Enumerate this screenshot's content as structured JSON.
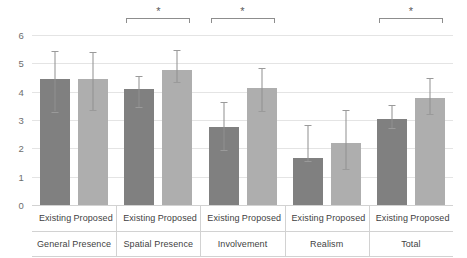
{
  "chart_data": {
    "type": "bar",
    "title": "",
    "subtitle": "",
    "xlabel": "",
    "ylabel": "",
    "ylim": [
      0,
      6
    ],
    "ytick_step": 1,
    "ytick_labels": [
      "0",
      "1",
      "2",
      "3",
      "4",
      "5",
      "6"
    ],
    "grid": true,
    "legend_position": "none",
    "categories": [
      "General Presence",
      "Spatial Presence",
      "Involvement",
      "Realism",
      "Total"
    ],
    "series": [
      {
        "name": "Existing",
        "color": "#808080",
        "values": [
          4.43,
          4.1,
          2.76,
          1.66,
          3.04
        ],
        "error_low": [
          3.3,
          3.47,
          1.93,
          1.55,
          2.72
        ],
        "error_high": [
          5.43,
          4.57,
          3.65,
          2.83,
          3.52
        ]
      },
      {
        "name": "Proposed",
        "color": "#aeaeae",
        "values": [
          4.43,
          4.77,
          4.13,
          2.19,
          3.78
        ],
        "error_low": [
          3.37,
          4.33,
          3.33,
          1.28,
          3.21
        ],
        "error_high": [
          5.4,
          5.48,
          4.83,
          3.34,
          4.49
        ]
      }
    ],
    "series_tick_labels": [
      "Existing",
      "Proposed",
      "Existing",
      "Proposed",
      "Existing",
      "Proposed",
      "Existing",
      "Proposed",
      "Existing",
      "Proposed"
    ],
    "annotations": [
      {
        "type": "significance-bracket",
        "label": "*",
        "group": "Spatial Presence",
        "from": "Existing",
        "to": "Proposed"
      },
      {
        "type": "significance-bracket",
        "label": "*",
        "group": "Involvement",
        "from": "Existing",
        "to": "Proposed"
      },
      {
        "type": "significance-bracket",
        "label": "*",
        "group": "Total",
        "from": "Existing",
        "to": "Proposed"
      }
    ]
  },
  "colors": {
    "existing": "#808080",
    "proposed": "#aeaeae",
    "grid": "#e4e4e4",
    "axis_text": "#6d6d6d",
    "label_text": "#3f3f3f",
    "error_bar": "#909090",
    "bracket": "#8d8d8d"
  }
}
